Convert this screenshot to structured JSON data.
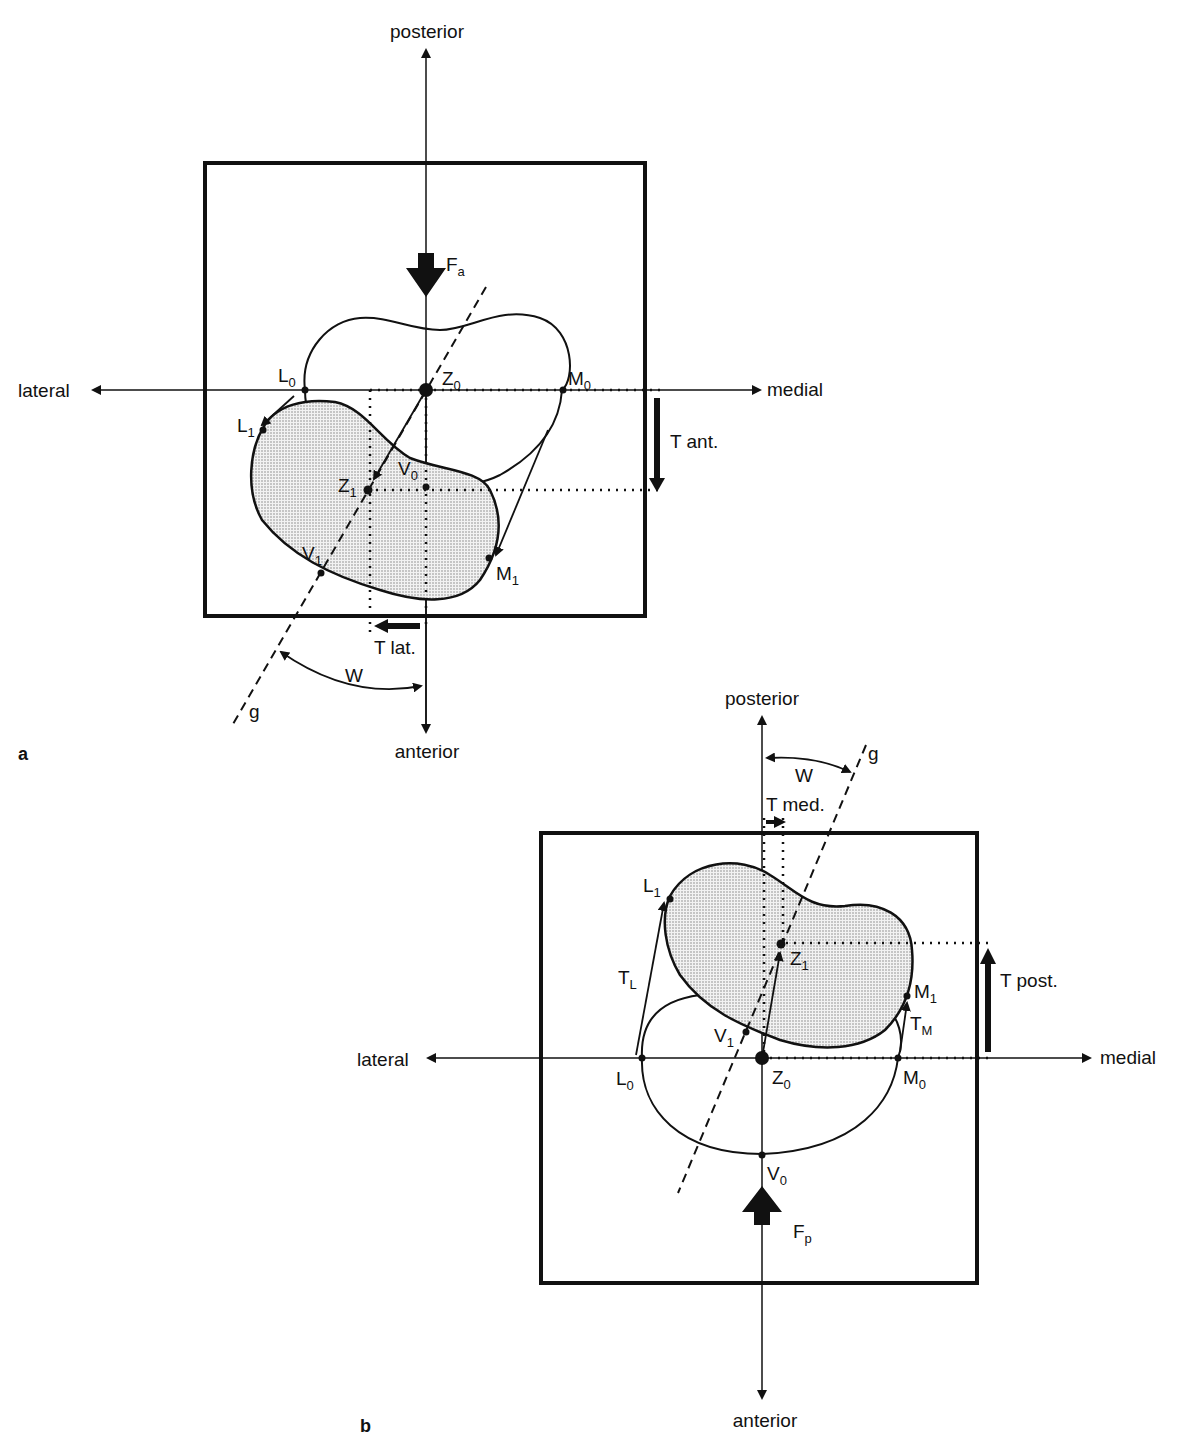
{
  "figure": {
    "panels": [
      {
        "id": "a",
        "panel_label": "a",
        "axis_labels": {
          "top": "posterior",
          "bottom": "anterior",
          "left": "lateral",
          "right": "medial"
        },
        "force": {
          "symbol": "F",
          "subscript": "a"
        },
        "points": [
          {
            "symbol": "L",
            "subscript": "0"
          },
          {
            "symbol": "L",
            "subscript": "1"
          },
          {
            "symbol": "Z",
            "subscript": "0"
          },
          {
            "symbol": "Z",
            "subscript": "1"
          },
          {
            "symbol": "M",
            "subscript": "0"
          },
          {
            "symbol": "M",
            "subscript": "1"
          },
          {
            "symbol": "V",
            "subscript": "0"
          },
          {
            "symbol": "V",
            "subscript": "1"
          }
        ],
        "translations": {
          "vertical": "T ant.",
          "horizontal": "T lat."
        },
        "angle_label": "W",
        "line_label": "g"
      },
      {
        "id": "b",
        "panel_label": "b",
        "axis_labels": {
          "top": "posterior",
          "bottom": "anterior",
          "left": "lateral",
          "right": "medial"
        },
        "force": {
          "symbol": "F",
          "subscript": "p"
        },
        "points": [
          {
            "symbol": "L",
            "subscript": "0"
          },
          {
            "symbol": "L",
            "subscript": "1"
          },
          {
            "symbol": "Z",
            "subscript": "0"
          },
          {
            "symbol": "Z",
            "subscript": "1"
          },
          {
            "symbol": "M",
            "subscript": "0"
          },
          {
            "symbol": "M",
            "subscript": "1"
          },
          {
            "symbol": "V",
            "subscript": "0"
          },
          {
            "symbol": "V",
            "subscript": "1"
          }
        ],
        "vectors": [
          {
            "symbol": "T",
            "subscript": "L"
          },
          {
            "symbol": "T",
            "subscript": "M"
          }
        ],
        "translations": {
          "vertical": "T post.",
          "horizontal": "T med."
        },
        "angle_label": "W",
        "line_label": "g"
      }
    ]
  }
}
